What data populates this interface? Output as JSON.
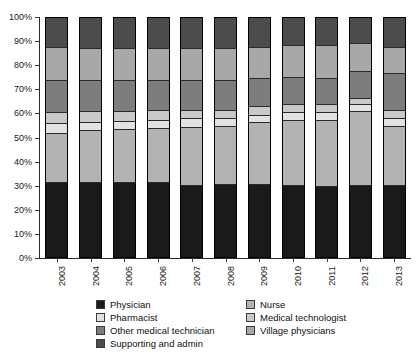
{
  "chart_data": {
    "type": "bar",
    "stacked": true,
    "normalized": true,
    "title": "",
    "xlabel": "",
    "ylabel": "",
    "ylim": [
      0,
      100
    ],
    "ytick_labels": [
      "100%",
      "90%",
      "80%",
      "70%",
      "60%",
      "50%",
      "40%",
      "30%",
      "20%",
      "10%",
      "0%"
    ],
    "ytick_values": [
      100,
      90,
      80,
      70,
      60,
      50,
      40,
      30,
      20,
      10,
      0
    ],
    "grid": false,
    "legend_position": "bottom",
    "categories": [
      "2003",
      "2004",
      "2005",
      "2006",
      "2007",
      "2008",
      "2009",
      "2010",
      "2011",
      "2012",
      "2013"
    ],
    "series": [
      {
        "name": "Physician",
        "color": "#1a1a1a",
        "values": [
          31.5,
          31.5,
          31.5,
          31.5,
          30.0,
          30.5,
          30.5,
          30.0,
          29.5,
          30.0,
          30.0
        ]
      },
      {
        "name": "Nurse",
        "color": "#b3b3b3",
        "values": [
          20.5,
          21.5,
          22.0,
          22.5,
          24.5,
          24.5,
          26.0,
          27.5,
          28.0,
          31.0,
          25.0
        ]
      },
      {
        "name": "Pharmacist",
        "color": "#e2e2e2",
        "values": [
          4.0,
          3.5,
          3.5,
          3.5,
          3.5,
          3.0,
          3.0,
          3.0,
          3.0,
          3.0,
          3.0
        ]
      },
      {
        "name": "Medical technologist",
        "color": "#c9c9c9",
        "values": [
          4.5,
          4.5,
          4.0,
          4.0,
          3.5,
          3.5,
          3.5,
          3.5,
          3.5,
          2.5,
          3.5
        ]
      },
      {
        "name": "Other medical technician",
        "color": "#7d7d7d",
        "values": [
          13.5,
          13.0,
          13.0,
          12.5,
          12.5,
          12.5,
          12.0,
          11.5,
          11.0,
          11.5,
          15.5
        ]
      },
      {
        "name": "Village physicians",
        "color": "#a8a8a8",
        "values": [
          14.0,
          13.5,
          13.5,
          13.5,
          13.5,
          13.5,
          13.0,
          13.0,
          13.5,
          11.5,
          11.0
        ]
      },
      {
        "name": "Supporting and admin",
        "color": "#4c4c4c",
        "values": [
          12.0,
          12.5,
          12.5,
          12.5,
          12.5,
          12.5,
          12.0,
          11.5,
          11.5,
          10.5,
          12.0
        ]
      }
    ]
  },
  "legend": {
    "columns": [
      [
        {
          "label": "Physician",
          "color": "#1a1a1a"
        },
        {
          "label": "Pharmacist",
          "color": "#e2e2e2"
        },
        {
          "label": "Other medical technician",
          "color": "#7d7d7d"
        },
        {
          "label": "Supporting and admin",
          "color": "#4c4c4c"
        }
      ],
      [
        {
          "label": "Nurse",
          "color": "#b3b3b3"
        },
        {
          "label": "Medical technologist",
          "color": "#c9c9c9"
        },
        {
          "label": "Village physicians",
          "color": "#a8a8a8"
        }
      ]
    ]
  }
}
